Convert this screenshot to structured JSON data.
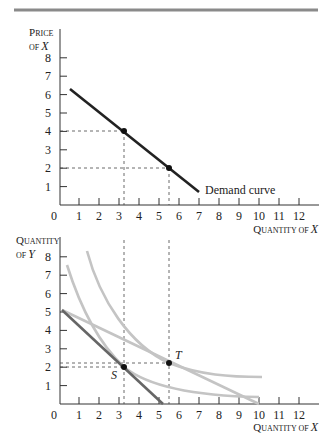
{
  "header_rule": {
    "color": "#8a8a8a"
  },
  "chart_data": [
    {
      "type": "line",
      "title": "",
      "ylabel": {
        "line1_cap": "P",
        "line1_rest": "RICE",
        "line2_small": "OF ",
        "line2_var": "X"
      },
      "xlabel": {
        "cap1": "Q",
        "rest1": "UANTITY OF ",
        "var": "X"
      },
      "x_ticks": [
        "1",
        "2",
        "3",
        "4",
        "5",
        "6",
        "7",
        "8",
        "9",
        "10",
        "11",
        "12"
      ],
      "y_ticks": [
        "1",
        "2",
        "3",
        "4",
        "5",
        "6",
        "7",
        "8"
      ],
      "origin_label": "0",
      "xlim": [
        0,
        13
      ],
      "ylim": [
        0,
        8.5
      ],
      "grid": false,
      "series": [
        {
          "name": "Demand curve",
          "color": "#222222",
          "points": [
            [
              0.55,
              6.3
            ],
            [
              7.0,
              0.7
            ]
          ]
        }
      ],
      "marked_points": [
        {
          "x": 3.25,
          "y": 4,
          "dashed_guides": true
        },
        {
          "x": 5.5,
          "y": 2,
          "dashed_guides": true
        }
      ],
      "annotations": [
        {
          "text": "Demand curve",
          "x": 7.2,
          "y": 0.6
        }
      ]
    },
    {
      "type": "line",
      "title": "",
      "ylabel": {
        "line1_cap": "Q",
        "line1_rest": "UANTITY",
        "line2_small": "OF ",
        "line2_var": "Y"
      },
      "xlabel": {
        "cap1": "Q",
        "rest1": "UANTITY OF ",
        "var": "X"
      },
      "x_ticks": [
        "1",
        "2",
        "3",
        "4",
        "5",
        "6",
        "7",
        "8",
        "9",
        "10",
        "11",
        "12"
      ],
      "y_ticks": [
        "1",
        "2",
        "3",
        "4",
        "5",
        "6",
        "7",
        "8"
      ],
      "origin_label": "0",
      "xlim": [
        0,
        13
      ],
      "ylim": [
        0,
        8.5
      ],
      "grid": false,
      "series": [
        {
          "name": "Budget line (original)",
          "color": "#666666",
          "style": "solid",
          "points": [
            [
              0.15,
              5.1
            ],
            [
              5.2,
              0
            ]
          ]
        },
        {
          "name": "Budget line (lower price of X)",
          "color": "#c4c4c4",
          "style": "solid",
          "points": [
            [
              0.15,
              5.1
            ],
            [
              10.0,
              0
            ]
          ]
        },
        {
          "name": "Indifference curve (lower)",
          "color": "#c4c4c4",
          "style": "curve",
          "points": [
            [
              0.4,
              7.6
            ],
            [
              1.5,
              4.3
            ],
            [
              3.25,
              2.0
            ],
            [
              5.0,
              1.05
            ],
            [
              7.0,
              0.6
            ],
            [
              10.0,
              0.4
            ]
          ]
        },
        {
          "name": "Indifference curve (higher)",
          "color": "#c4c4c4",
          "style": "curve",
          "points": [
            [
              1.4,
              8.3
            ],
            [
              2.5,
              5.6
            ],
            [
              3.8,
              3.6
            ],
            [
              5.5,
              2.25
            ],
            [
              7.5,
              1.65
            ],
            [
              10.1,
              1.5
            ]
          ]
        }
      ],
      "marked_points": [
        {
          "label": "S",
          "x": 3.25,
          "y": 2.0,
          "dashed_guides": true
        },
        {
          "label": "T",
          "x": 5.5,
          "y": 2.25,
          "dashed_guides": true
        }
      ],
      "vertical_guides_extend_to_top": [
        3.25,
        5.5
      ]
    }
  ]
}
